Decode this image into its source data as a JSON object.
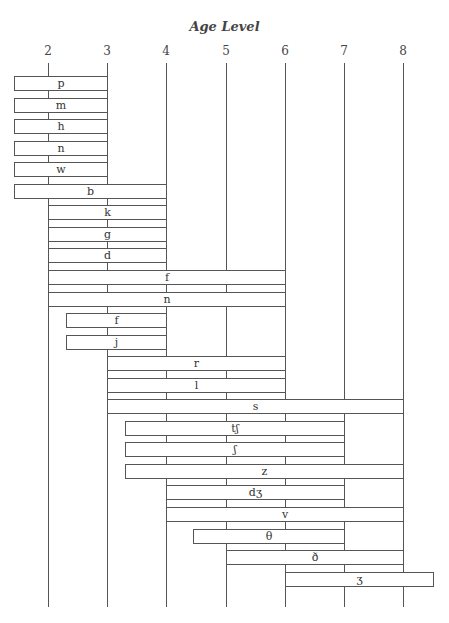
{
  "chart_data": {
    "type": "bar",
    "orientation": "horizontal-range",
    "title": "Age Level",
    "xlabel": "Age Level",
    "ylabel": "",
    "xlim": [
      1.43,
      8.5
    ],
    "x_ticks": [
      "2",
      "3",
      "4",
      "5",
      "6",
      "7",
      "8"
    ],
    "grid": true,
    "legend": null,
    "bars": [
      {
        "label": "p",
        "start": 1.43,
        "end": 3
      },
      {
        "label": "m",
        "start": 1.43,
        "end": 3
      },
      {
        "label": "h",
        "start": 1.43,
        "end": 3
      },
      {
        "label": "n",
        "start": 1.43,
        "end": 3
      },
      {
        "label": "w",
        "start": 1.43,
        "end": 3
      },
      {
        "label": "b",
        "start": 1.43,
        "end": 4
      },
      {
        "label": "k",
        "start": 2,
        "end": 4
      },
      {
        "label": "g",
        "start": 2,
        "end": 4
      },
      {
        "label": "d",
        "start": 2,
        "end": 4
      },
      {
        "label": "f",
        "start": 2,
        "end": 6
      },
      {
        "label": "n",
        "start": 2,
        "end": 6
      },
      {
        "label": "f",
        "start": 2.3,
        "end": 4
      },
      {
        "label": "j",
        "start": 2.3,
        "end": 4
      },
      {
        "label": "r",
        "start": 3,
        "end": 6
      },
      {
        "label": "l",
        "start": 3,
        "end": 6
      },
      {
        "label": "s",
        "start": 3,
        "end": 8
      },
      {
        "label": "tʃ",
        "start": 3.3,
        "end": 7
      },
      {
        "label": "ʃ",
        "start": 3.3,
        "end": 7
      },
      {
        "label": "z",
        "start": 3.3,
        "end": 8
      },
      {
        "label": "dʒ",
        "start": 4,
        "end": 7
      },
      {
        "label": "v",
        "start": 4,
        "end": 8
      },
      {
        "label": "θ",
        "start": 4.45,
        "end": 7
      },
      {
        "label": "ð",
        "start": 5,
        "end": 8
      },
      {
        "label": "ʒ",
        "start": 6,
        "end": 8.5
      }
    ]
  }
}
